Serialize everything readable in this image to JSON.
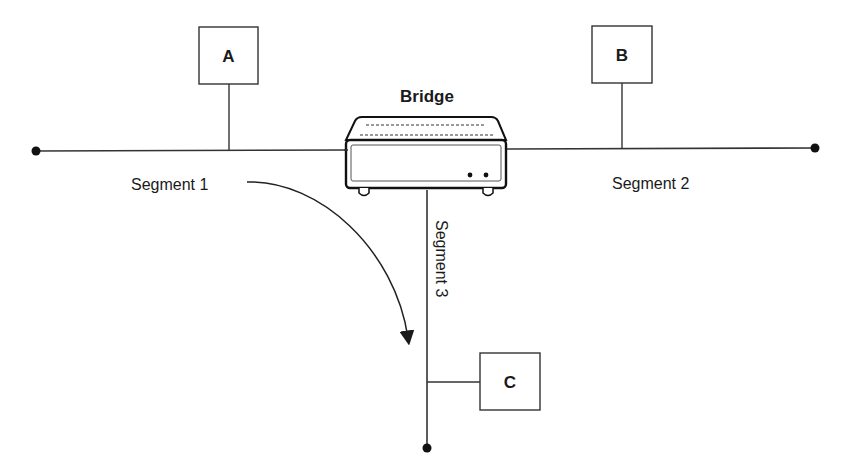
{
  "diagram": {
    "type": "network-topology",
    "device": {
      "label": "Bridge",
      "icon": "bridge-device-icon"
    },
    "nodes": [
      {
        "id": "A",
        "label": "A",
        "segment": "Segment 1"
      },
      {
        "id": "B",
        "label": "B",
        "segment": "Segment 2"
      },
      {
        "id": "C",
        "label": "C",
        "segment": "Segment 3"
      }
    ],
    "segments": [
      {
        "label": "Segment 1"
      },
      {
        "label": "Segment 2"
      },
      {
        "label": "Segment 3"
      }
    ],
    "arrow": {
      "from": "Segment 1",
      "to": "Segment 3"
    },
    "colors": {
      "line": "#333333",
      "background": "#ffffff"
    }
  }
}
